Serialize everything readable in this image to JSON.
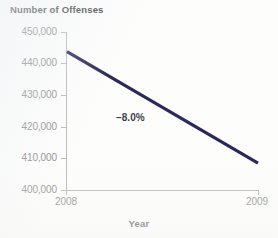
{
  "chart_data": {
    "type": "line",
    "title": "Number of Offenses",
    "xlabel": "Year",
    "ylabel": "",
    "x": [
      "2008",
      "2009"
    ],
    "categories": [
      "2008",
      "2009"
    ],
    "values": [
      443800,
      408500
    ],
    "series": [
      {
        "name": "Number of Offenses",
        "values": [
          443800,
          408500
        ],
        "color": "#2a2a5a"
      }
    ],
    "ylim": [
      400000,
      450000
    ],
    "yticks": [
      400000,
      410000,
      420000,
      430000,
      440000,
      450000
    ],
    "ytick_labels": [
      "400,000",
      "410,000",
      "420,000",
      "430,000",
      "440,000",
      "450,000"
    ],
    "xtick_labels": [
      "2008",
      "2009"
    ],
    "grid": false,
    "legend": false,
    "annotations": [
      {
        "text": "–8.0%",
        "x": "midpoint",
        "y": 422000
      }
    ]
  },
  "chart": {
    "title": "Number of Offenses",
    "x_axis_title": "Year",
    "delta_label": "–8.0%",
    "y_labels": [
      "450,000",
      "440,000",
      "430,000",
      "420,000",
      "410,000",
      "400,000"
    ],
    "x_labels": [
      "2008",
      "2009"
    ],
    "colors": {
      "line": "#2a2a5a",
      "axis": "#b9b9b9",
      "tick_text": "#8d8d8d",
      "title_text": "#4a4a4a",
      "annotation_text": "#3d3d4a",
      "background": "#fdfdfc"
    }
  }
}
